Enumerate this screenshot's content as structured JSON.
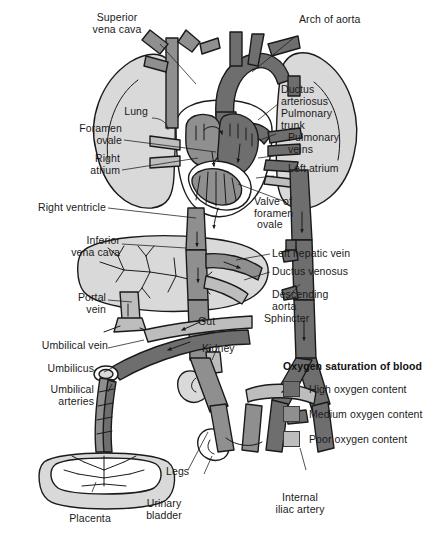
{
  "figure": {
    "background": "#ffffff"
  },
  "palette": {
    "high_oxygen": "#6e6e6e",
    "medium_oxygen": "#8f8f8f",
    "poor_oxygen": "#bdbdbd",
    "organ_fill": "#d9d9d9",
    "outline": "#1a1a1a",
    "text": "#1a1a1a"
  },
  "labels": {
    "superior_vena_cava": "Superior\nvena cava",
    "arch_of_aorta": "Arch of aorta",
    "ductus_arteriosus": "Ductus\narteriosus",
    "pulmonary_trunk": "Pulmonary\ntrunk",
    "pulmonary_veins": "Pulmonary\nveins",
    "left_atrium": "Left atrium",
    "lung": "Lung",
    "foramen_ovale": "Foramen\novale",
    "right_atrium": "Right\natrium",
    "right_ventricle": "Right ventricle",
    "valve_of_foramen_ovale": "Valve of\nforamen\n ovale",
    "inferior_vena_cava": "Inferior\nvena cava",
    "left_hepatic_vein": "Left hepatic vein",
    "ductus_venosus": "Ductus venosus",
    "descending_aorta": "Descending\naorta",
    "portal_vein": "Portal\nvein",
    "gut": "Gut",
    "sphincter": "Sphincter",
    "umbilical_vein": "Umbilical vein",
    "kidney": "Kidney",
    "umbilicus": "Umbilicus",
    "umbilical_arteries": "Umbilical\narteries",
    "placenta": "Placenta",
    "legs": "Legs",
    "urinary_bladder": "Urinary\nbladder",
    "internal_iliac_artery": "Internal\niliac artery"
  },
  "legend": {
    "title": "Oxygen saturation of blood",
    "items": [
      {
        "label": "High oxygen content",
        "color": "#6e6e6e"
      },
      {
        "label": "Medium oxygen content",
        "color": "#8f8f8f"
      },
      {
        "label": "Poor oxygen content",
        "color": "#bdbdbd"
      }
    ]
  }
}
